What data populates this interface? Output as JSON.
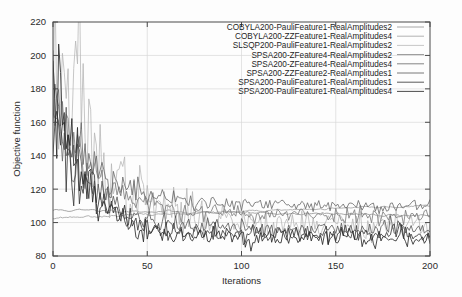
{
  "chart_data": {
    "type": "line",
    "title": "",
    "xlabel": "Iterations",
    "ylabel": "Objective function",
    "xlim": [
      0,
      200
    ],
    "ylim": [
      80,
      220
    ],
    "xticks": [
      0,
      50,
      100,
      150,
      200
    ],
    "yticks": [
      80,
      100,
      120,
      140,
      160,
      180,
      200,
      220
    ],
    "grid": true,
    "legend_position": "top-right",
    "series": [
      {
        "name": "COBYLA200-PauliFeature1-RealAmplitudes2",
        "color": "#8a8a8a",
        "width": 0.75,
        "kind": "smooth-flat",
        "start": 107.5,
        "end": 104.2,
        "noise": 1.6,
        "seed": 11
      },
      {
        "name": "COBYLA200-ZZFeature1-RealAmplitudes4",
        "color": "#9a9a9a",
        "width": 0.75,
        "kind": "smooth-flat",
        "start": 103.0,
        "end": 110.2,
        "noise": 1.2,
        "seed": 23
      },
      {
        "name": "SLSQP200-PauliFeature1-RealAmplitudes2",
        "color": "#b4b4b4",
        "width": 0.75,
        "kind": "spike-decay",
        "start": 195.0,
        "end": 99.0,
        "decay": 26.0,
        "noise": 26.0,
        "seed": 37
      },
      {
        "name": "SPSA200-ZFeature4-RealAmplitudes2",
        "color": "#787878",
        "width": 0.8,
        "kind": "decay",
        "start": 182.0,
        "end": 104.5,
        "decay": 21.0,
        "noise": 13.0,
        "seed": 53
      },
      {
        "name": "SPSA200-ZFeature4-RealAmplitudes4",
        "color": "#676767",
        "width": 0.8,
        "kind": "decay",
        "start": 170.0,
        "end": 110.0,
        "decay": 23.0,
        "noise": 12.0,
        "seed": 71
      },
      {
        "name": "SPSA200-ZZFeature2-RealAmplitudes1",
        "color": "#555555",
        "width": 0.8,
        "kind": "decay",
        "start": 176.0,
        "end": 96.5,
        "decay": 19.0,
        "noise": 14.0,
        "seed": 89
      },
      {
        "name": "SPSA200-PauliFeature1-RealAmplitudes1",
        "color": "#3c3c3c",
        "width": 0.85,
        "kind": "decay",
        "start": 166.0,
        "end": 93.0,
        "decay": 18.0,
        "noise": 15.0,
        "seed": 101
      },
      {
        "name": "SPSA200-PauliFeature1-RealAmplitudes4",
        "color": "#2a2a2a",
        "width": 0.85,
        "kind": "decay",
        "start": 188.0,
        "end": 90.5,
        "decay": 17.0,
        "noise": 16.0,
        "seed": 127
      }
    ]
  },
  "axes": {
    "yticks_text": [
      "80",
      "100",
      "120",
      "140",
      "160",
      "180",
      "200",
      "220"
    ],
    "xticks_text": [
      "0",
      "50",
      "100",
      "150",
      "200"
    ],
    "xlabel_text": "Iterations",
    "ylabel_text": "Objective function"
  }
}
